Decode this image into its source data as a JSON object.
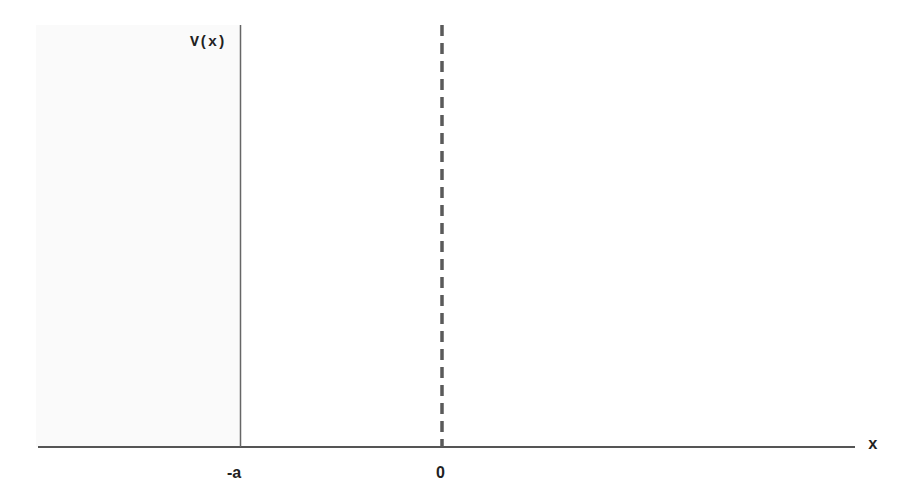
{
  "diagram": {
    "type": "potential-well-sketch",
    "y_axis_label": "V(x)",
    "x_axis_label": "x",
    "tick_labels": [
      "-a",
      "0"
    ],
    "elements": [
      {
        "name": "horizontal-axis",
        "style": "solid"
      },
      {
        "name": "wall-at-minus-a",
        "style": "solid",
        "at": "-a"
      },
      {
        "name": "origin-line",
        "style": "dashed",
        "at": "0"
      }
    ],
    "colors": {
      "axis": "#555555",
      "dashed": "#5a5a5a",
      "text": "#222222"
    }
  }
}
